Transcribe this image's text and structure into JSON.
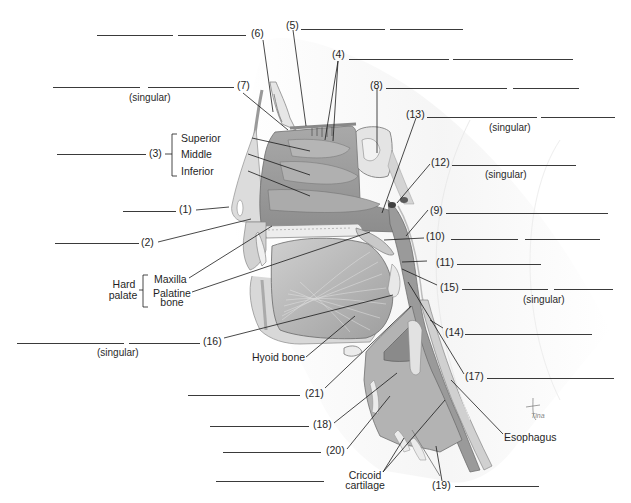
{
  "diagram": {
    "numbered_labels": [
      {
        "id": "1",
        "text": "(1)"
      },
      {
        "id": "2",
        "text": "(2)"
      },
      {
        "id": "3",
        "text": "(3)"
      },
      {
        "id": "4",
        "text": "(4)"
      },
      {
        "id": "5",
        "text": "(5)"
      },
      {
        "id": "6",
        "text": "(6)"
      },
      {
        "id": "7",
        "text": "(7)"
      },
      {
        "id": "8",
        "text": "(8)"
      },
      {
        "id": "9",
        "text": "(9)"
      },
      {
        "id": "10",
        "text": "(10)"
      },
      {
        "id": "11",
        "text": "(11)"
      },
      {
        "id": "12",
        "text": "(12)"
      },
      {
        "id": "13",
        "text": "(13)"
      },
      {
        "id": "14",
        "text": "(14)"
      },
      {
        "id": "15",
        "text": "(15)"
      },
      {
        "id": "16",
        "text": "(16)"
      },
      {
        "id": "17",
        "text": "(17)"
      },
      {
        "id": "18",
        "text": "(18)"
      },
      {
        "id": "19",
        "text": "(19)"
      },
      {
        "id": "20",
        "text": "(20)"
      },
      {
        "id": "21",
        "text": "(21)"
      }
    ],
    "named_labels": {
      "superior": "Superior",
      "middle": "Middle",
      "inferior": "Inferior",
      "hard": "Hard",
      "palate": "palate",
      "maxilla": "Maxilla",
      "palatine": "Palatine",
      "bone": "bone",
      "hyoid_bone": "Hyoid bone",
      "esophagus": "Esophagus",
      "cricoid": "Cricoid",
      "cartilage": "cartilage"
    },
    "notes": {
      "singular": "(singular)"
    },
    "signature": "Tina"
  }
}
